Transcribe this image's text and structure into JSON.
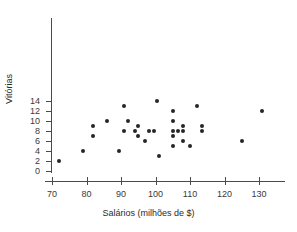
{
  "chart_data": {
    "type": "scatter",
    "title": "",
    "xlabel": "Salários (milhões de $)",
    "ylabel": "Vitórias",
    "xlim": [
      67,
      136
    ],
    "ylim": [
      0,
      15
    ],
    "xticks": [
      70,
      80,
      90,
      100,
      110,
      120,
      130
    ],
    "yticks": [
      0,
      2,
      4,
      6,
      8,
      10,
      12,
      14
    ],
    "grid": false,
    "legend": null,
    "marker": {
      "shape": "circle",
      "color": "#262626",
      "size": 4
    },
    "points": [
      {
        "x": 72,
        "y": 2
      },
      {
        "x": 79,
        "y": 4
      },
      {
        "x": 82,
        "y": 9
      },
      {
        "x": 82,
        "y": 7
      },
      {
        "x": 86,
        "y": 10
      },
      {
        "x": 89.5,
        "y": 4
      },
      {
        "x": 91,
        "y": 13
      },
      {
        "x": 91,
        "y": 8
      },
      {
        "x": 92,
        "y": 10
      },
      {
        "x": 94,
        "y": 8
      },
      {
        "x": 95,
        "y": 9
      },
      {
        "x": 95,
        "y": 7
      },
      {
        "x": 97,
        "y": 6
      },
      {
        "x": 98,
        "y": 8
      },
      {
        "x": 99.5,
        "y": 8
      },
      {
        "x": 100.5,
        "y": 14
      },
      {
        "x": 101,
        "y": 3
      },
      {
        "x": 105,
        "y": 12
      },
      {
        "x": 105,
        "y": 10
      },
      {
        "x": 105,
        "y": 8
      },
      {
        "x": 105,
        "y": 7
      },
      {
        "x": 105,
        "y": 5
      },
      {
        "x": 106.5,
        "y": 8
      },
      {
        "x": 108,
        "y": 9
      },
      {
        "x": 108,
        "y": 8
      },
      {
        "x": 108,
        "y": 6
      },
      {
        "x": 110,
        "y": 5
      },
      {
        "x": 112,
        "y": 13
      },
      {
        "x": 113.5,
        "y": 9
      },
      {
        "x": 113.5,
        "y": 8
      },
      {
        "x": 125,
        "y": 6
      },
      {
        "x": 131,
        "y": 12
      }
    ]
  }
}
